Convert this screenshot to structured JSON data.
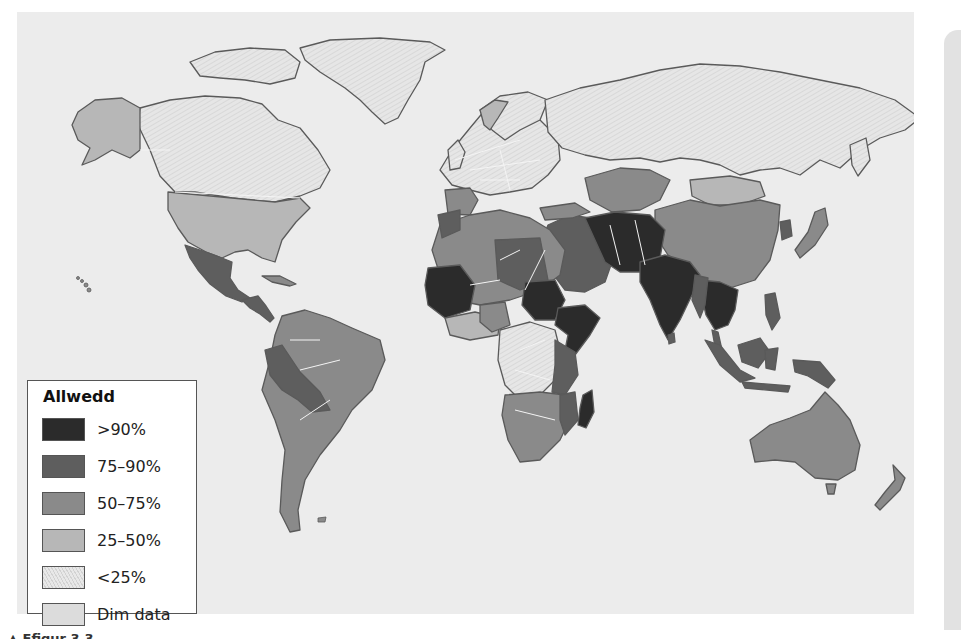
{
  "map": {
    "legend": {
      "title": "Allwedd",
      "items": [
        {
          "label": ">90%",
          "color": "#2b2b2b"
        },
        {
          "label": "75–90%",
          "color": "#5e5e5e"
        },
        {
          "label": "50–75%",
          "color": "#8a8a8a"
        },
        {
          "label": "25–50%",
          "color": "#b7b7b7"
        },
        {
          "label": "<25%",
          "color": "#e4e4e4",
          "pattern": "hatched"
        },
        {
          "label": "Dim data",
          "color": "#dcdcdc",
          "pattern": "dotted"
        }
      ]
    },
    "caption": "▲ Ffigur 3.3",
    "colors": {
      "ocean": "#ececec",
      "outline": "#5a5a5a",
      "border": "#f4f4f4"
    },
    "regions": [
      {
        "name": "Canada",
        "class": "<25%"
      },
      {
        "name": "Greenland",
        "class": "<25%"
      },
      {
        "name": "Alaska",
        "class": "25–50%"
      },
      {
        "name": "USA",
        "class": "25–50%"
      },
      {
        "name": "Mexico",
        "class": "75–90%"
      },
      {
        "name": "Central America",
        "class": "75–90%"
      },
      {
        "name": "South America",
        "class": "50–75%"
      },
      {
        "name": "Peru/Bolivia",
        "class": "75–90%"
      },
      {
        "name": "Europe",
        "class": "<25%"
      },
      {
        "name": "Russia",
        "class": "<25%"
      },
      {
        "name": "North Africa",
        "class": "50–75%"
      },
      {
        "name": "Mali/Mauritania",
        "class": ">90%"
      },
      {
        "name": "Sudan",
        "class": ">90%"
      },
      {
        "name": "Ethiopia/Somalia",
        "class": ">90%"
      },
      {
        "name": "Central Africa",
        "class": "<25%"
      },
      {
        "name": "Southern Africa",
        "class": "50–75%"
      },
      {
        "name": "Madagascar",
        "class": ">90%"
      },
      {
        "name": "Middle East",
        "class": "75–90%"
      },
      {
        "name": "Iran/Afghanistan/Pakistan",
        "class": ">90%"
      },
      {
        "name": "India",
        "class": ">90%"
      },
      {
        "name": "Central Asia",
        "class": "50–75%"
      },
      {
        "name": "Mongolia",
        "class": "25–50%"
      },
      {
        "name": "China",
        "class": "50–75%"
      },
      {
        "name": "Southeast Asia",
        "class": ">90%"
      },
      {
        "name": "Indonesia",
        "class": "75–90%"
      },
      {
        "name": "Japan",
        "class": "50–75%"
      },
      {
        "name": "Australia",
        "class": "50–75%"
      },
      {
        "name": "New Zealand",
        "class": "50–75%"
      }
    ]
  }
}
